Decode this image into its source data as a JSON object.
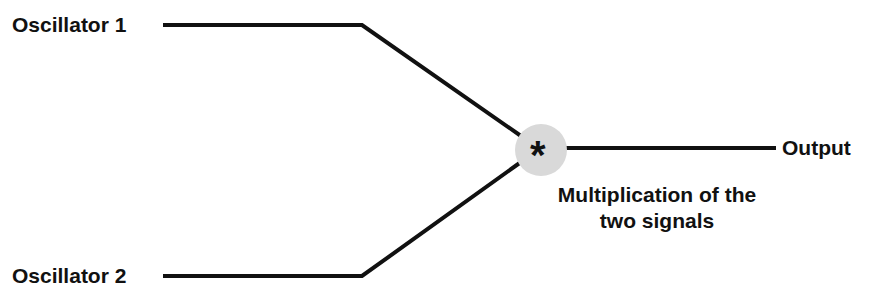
{
  "diagram": {
    "inputs": [
      {
        "label": "Oscillator 1"
      },
      {
        "label": "Oscillator 2"
      }
    ],
    "operator": {
      "symbol": "*",
      "fill": "#d9d9d9"
    },
    "output": {
      "label": "Output"
    },
    "caption": {
      "line1": "Multiplication of the",
      "line2": "two signals"
    },
    "colors": {
      "line": "#111111",
      "text": "#111111",
      "node": "#d9d9d9"
    }
  }
}
